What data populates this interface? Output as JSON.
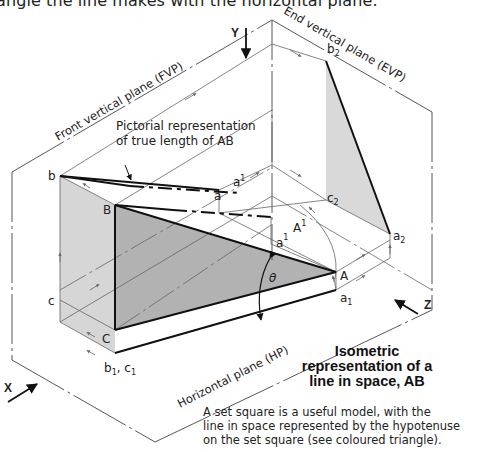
{
  "caption_top": "angle the line makes with the horizontal plane.",
  "planes": {
    "fvp": "Front vertical plane (FVP)",
    "evp": "End vertical plane (EVP)",
    "hp": "Horizontal plane (HP)"
  },
  "axes": {
    "x": "X",
    "y": "Y",
    "z": "Z"
  },
  "annotation": {
    "line1": "Pictorial representation",
    "line2": "of true length of AB"
  },
  "points": {
    "b": "b",
    "B": "B",
    "a": "a",
    "a1_sup": "a",
    "a1_sup_mark": "1",
    "A1": "A",
    "A1_mark": "1",
    "a1_sub": "a",
    "a1_sub_mark": "1",
    "A": "A",
    "a_1": "a",
    "a_1_sub": "1",
    "c": "c",
    "C": "C",
    "b1c1": "b",
    "b1c1_sub1": "1",
    "b1c1_mid": ", c",
    "b1c1_sub2": "1",
    "b2": "b",
    "b2_sub": "2",
    "c2": "c",
    "c2_sub": "2",
    "a2": "a",
    "a2_sub": "2",
    "theta": "θ"
  },
  "title": {
    "line1": "Isometric",
    "line2": "representation of a",
    "line3": "line in space, AB"
  },
  "note": {
    "line1": "A set square is a useful model, with the",
    "line2": "line in space represented by the hypotenuse",
    "line3": "on the set square (see coloured triangle)."
  },
  "colors": {
    "light_face": "#d6d6d6",
    "dark_triangle": "#b2b2b2",
    "evp_face": "#d9d9d9",
    "line": "#555555",
    "bold_line": "#111111"
  }
}
